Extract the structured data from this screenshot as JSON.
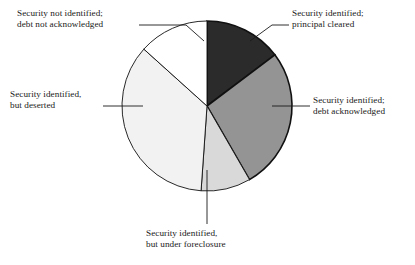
{
  "chart_data": {
    "type": "pie",
    "title": "",
    "subtitle": "",
    "xlabel": "",
    "ylabel": "",
    "legend_position": "callout-labels",
    "grid": false,
    "total_degrees": 360,
    "start_angle_deg": 0,
    "direction": "clockwise",
    "categories": [
      "Security identified; principal cleared",
      "Security identified; debt acknowledged",
      "Security identified, but under foreclosure",
      "Security identified, but deserted",
      "Security not identified; debt not acknowledged"
    ],
    "values": [
      14.7,
      27.0,
      9.5,
      35.5,
      13.3
    ],
    "value_unit": "percent",
    "slices": [
      {
        "name": "principal-cleared",
        "label_line1": "Security identified;",
        "label_line2": "principal cleared",
        "value": 14.7,
        "start_deg": 0,
        "end_deg": 53,
        "color": "#2b2b2b"
      },
      {
        "name": "debt-acknowledged",
        "label_line1": "Security identified;",
        "label_line2": "debt acknowledged",
        "value": 27.0,
        "start_deg": 53,
        "end_deg": 150,
        "color": "#949494"
      },
      {
        "name": "under-foreclosure",
        "label_line1": "Security identified,",
        "label_line2": "but under foreclosure",
        "value": 9.5,
        "start_deg": 150,
        "end_deg": 184,
        "color": "#d9d9d9"
      },
      {
        "name": "deserted",
        "label_line1": "Security identified,",
        "label_line2": "but deserted",
        "value": 35.5,
        "start_deg": 184,
        "end_deg": 312,
        "color": "#f2f2f2"
      },
      {
        "name": "not-identified",
        "label_line1": "Security not identified;",
        "label_line2": "debt not acknowledged",
        "value": 13.3,
        "start_deg": 312,
        "end_deg": 360,
        "color": "#ffffff"
      }
    ],
    "colors": {
      "outline": "#111111",
      "leader_line": "#1a1a1a",
      "background": "#ffffff",
      "text": "#1a1a1a"
    }
  },
  "labels": {
    "top_left": {
      "line1": "Security not identified;",
      "line2": "debt not acknowledged"
    },
    "top_right": {
      "line1": "Security identified;",
      "line2": "principal cleared"
    },
    "right": {
      "line1": "Security identified;",
      "line2": "debt acknowledged"
    },
    "left": {
      "line1": "Security identified,",
      "line2": "but deserted"
    },
    "bottom": {
      "line1": "Security identified,",
      "line2": "but under foreclosure"
    }
  }
}
